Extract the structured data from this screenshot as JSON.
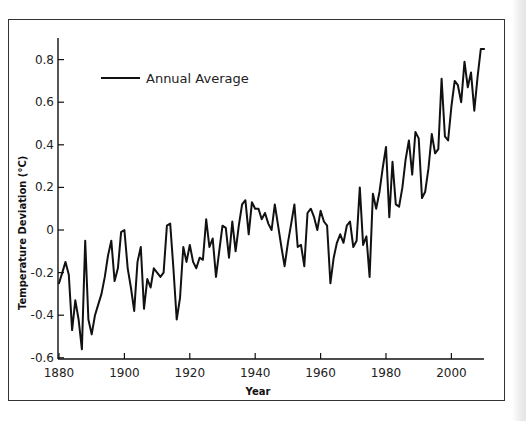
{
  "chart_data": {
    "type": "line",
    "title": "",
    "xlabel": "Year",
    "ylabel": "Temperature Deviation (°C)",
    "xlim": [
      1880,
      2010
    ],
    "ylim": [
      -0.6,
      0.9
    ],
    "grid": false,
    "legend_position": "upper-left (inside plot)",
    "x_ticks": [
      1880,
      1900,
      1920,
      1940,
      1960,
      1980,
      2000
    ],
    "x_tick_labels": [
      "1880",
      "1900",
      "1920",
      "1940",
      "1960",
      "1980",
      "2000"
    ],
    "y_ticks": [
      0.8,
      0.6,
      0.4,
      0.2,
      0,
      -0.2,
      -0.4,
      -0.6
    ],
    "y_tick_labels": [
      "0.8",
      "0.6",
      "0.4",
      "0.2",
      "0",
      "-0.2",
      "-0.4",
      "-0.6"
    ],
    "series": [
      {
        "name": "Annual Average",
        "color": "#111111",
        "x": [
          1880,
          1881,
          1882,
          1883,
          1884,
          1885,
          1886,
          1887,
          1888,
          1889,
          1890,
          1891,
          1892,
          1893,
          1894,
          1895,
          1896,
          1897,
          1898,
          1899,
          1900,
          1901,
          1902,
          1903,
          1904,
          1905,
          1906,
          1907,
          1908,
          1909,
          1910,
          1911,
          1912,
          1913,
          1914,
          1915,
          1916,
          1917,
          1918,
          1919,
          1920,
          1921,
          1922,
          1923,
          1924,
          1925,
          1926,
          1927,
          1928,
          1929,
          1930,
          1931,
          1932,
          1933,
          1934,
          1935,
          1936,
          1937,
          1938,
          1939,
          1940,
          1941,
          1942,
          1943,
          1944,
          1945,
          1946,
          1947,
          1948,
          1949,
          1950,
          1951,
          1952,
          1953,
          1954,
          1955,
          1956,
          1957,
          1958,
          1959,
          1960,
          1961,
          1962,
          1963,
          1964,
          1965,
          1966,
          1967,
          1968,
          1969,
          1970,
          1971,
          1972,
          1973,
          1974,
          1975,
          1976,
          1977,
          1978,
          1979,
          1980,
          1981,
          1982,
          1983,
          1984,
          1985,
          1986,
          1987,
          1988,
          1989,
          1990,
          1991,
          1992,
          1993,
          1994,
          1995,
          1996,
          1997,
          1998,
          1999,
          2000,
          2001,
          2002,
          2003,
          2004,
          2005,
          2006,
          2007,
          2008,
          2009,
          2010
        ],
        "values": [
          -0.25,
          -0.2,
          -0.15,
          -0.21,
          -0.47,
          -0.33,
          -0.42,
          -0.56,
          -0.05,
          -0.42,
          -0.49,
          -0.4,
          -0.35,
          -0.3,
          -0.22,
          -0.12,
          -0.05,
          -0.24,
          -0.18,
          -0.01,
          0.0,
          -0.18,
          -0.27,
          -0.38,
          -0.15,
          -0.08,
          -0.37,
          -0.23,
          -0.27,
          -0.18,
          -0.2,
          -0.22,
          -0.2,
          0.02,
          0.03,
          -0.18,
          -0.42,
          -0.32,
          -0.08,
          -0.15,
          -0.07,
          -0.15,
          -0.18,
          -0.13,
          -0.14,
          0.05,
          -0.08,
          -0.04,
          -0.22,
          -0.1,
          0.02,
          0.01,
          -0.13,
          0.04,
          -0.1,
          0.02,
          0.12,
          0.14,
          -0.02,
          0.13,
          0.1,
          0.1,
          0.05,
          0.08,
          0.03,
          0.0,
          0.12,
          0.02,
          -0.08,
          -0.17,
          -0.06,
          0.03,
          0.12,
          -0.08,
          -0.07,
          -0.17,
          0.08,
          0.1,
          0.06,
          0.0,
          0.09,
          0.04,
          0.02,
          -0.25,
          -0.13,
          -0.06,
          -0.02,
          -0.06,
          0.02,
          0.04,
          -0.08,
          -0.05,
          0.2,
          -0.07,
          -0.03,
          -0.22,
          0.17,
          0.1,
          0.18,
          0.29,
          0.39,
          0.06,
          0.32,
          0.12,
          0.11,
          0.2,
          0.33,
          0.42,
          0.26,
          0.46,
          0.43,
          0.15,
          0.18,
          0.29,
          0.45,
          0.36,
          0.38,
          0.71,
          0.44,
          0.42,
          0.58,
          0.7,
          0.68,
          0.6,
          0.79,
          0.67,
          0.74,
          0.56,
          0.72,
          0.85,
          0.85
        ]
      }
    ]
  },
  "legend": {
    "label": "Annual Average"
  },
  "axes": {
    "x_title": "Year",
    "y_title": "Temperature Deviation (°C)"
  }
}
